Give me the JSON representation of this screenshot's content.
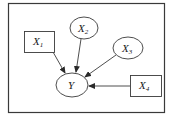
{
  "diagram": {
    "type": "causal-graph",
    "frame": {
      "x": 8,
      "y": 3,
      "w": 156,
      "h": 109
    },
    "colors": {
      "stroke": "#3a3a3a",
      "text": "#1a1a1a",
      "background": "#ffffff"
    },
    "nodes": [
      {
        "id": "X1",
        "base": "X",
        "sub": "1",
        "shape": "rect",
        "x": 24,
        "y": 31,
        "w": 30,
        "h": 21
      },
      {
        "id": "X2",
        "base": "X",
        "sub": "2",
        "shape": "ellipse",
        "cx": 84,
        "cy": 28,
        "rx": 14,
        "ry": 11
      },
      {
        "id": "X3",
        "base": "X",
        "sub": "3",
        "shape": "ellipse",
        "cx": 128,
        "cy": 48,
        "rx": 15,
        "ry": 11
      },
      {
        "id": "Y",
        "base": "Y",
        "sub": "",
        "shape": "ellipse",
        "cx": 72,
        "cy": 85,
        "rx": 16,
        "ry": 12
      },
      {
        "id": "X4",
        "base": "X",
        "sub": "4",
        "shape": "rect",
        "x": 130,
        "y": 75,
        "w": 31,
        "h": 21
      }
    ],
    "edges": [
      {
        "from": "X1",
        "to": "Y",
        "x1": 53,
        "y1": 52,
        "x2": 65,
        "y2": 73
      },
      {
        "from": "X2",
        "to": "Y",
        "x1": 81,
        "y1": 39,
        "x2": 76,
        "y2": 72
      },
      {
        "from": "X3",
        "to": "Y",
        "x1": 116,
        "y1": 55,
        "x2": 85,
        "y2": 77
      },
      {
        "from": "X4",
        "to": "Y",
        "x1": 130,
        "y1": 86,
        "x2": 89,
        "y2": 86
      }
    ]
  }
}
